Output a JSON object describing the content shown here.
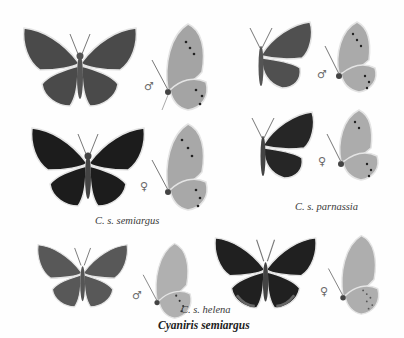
{
  "plate": {
    "title": "Cyaniris semiargus",
    "groups": [
      {
        "caption": "C. s. semiargus",
        "specimens": [
          {
            "view": "upperside",
            "sex": "male",
            "sex_symbol": "♂",
            "wing_tone": "#4a4a4a"
          },
          {
            "view": "underside",
            "sex": "male",
            "sex_symbol": "♂",
            "wing_tone": "#a4a4a4"
          },
          {
            "view": "upperside",
            "sex": "female",
            "sex_symbol": "♀",
            "wing_tone": "#1c1c1c"
          },
          {
            "view": "underside",
            "sex": "female",
            "sex_symbol": "♀",
            "wing_tone": "#a8a8a8"
          }
        ]
      },
      {
        "caption": "C. s. parnassia",
        "specimens": [
          {
            "view": "upperside",
            "sex": "male",
            "sex_symbol": "♂",
            "wing_tone": "#505050"
          },
          {
            "view": "underside",
            "sex": "male",
            "sex_symbol": "♂",
            "wing_tone": "#aaaaaa"
          },
          {
            "view": "upperside",
            "sex": "female",
            "sex_symbol": "♀",
            "wing_tone": "#262626"
          },
          {
            "view": "underside",
            "sex": "female",
            "sex_symbol": "♀",
            "wing_tone": "#acacac"
          }
        ]
      },
      {
        "caption": "C. s. helena",
        "specimens": [
          {
            "view": "upperside",
            "sex": "male",
            "sex_symbol": "♂",
            "wing_tone": "#585858"
          },
          {
            "view": "underside",
            "sex": "male",
            "sex_symbol": "♂",
            "wing_tone": "#b0b0b0"
          },
          {
            "view": "upperside",
            "sex": "female",
            "sex_symbol": "♀",
            "wing_tone": "#202020"
          },
          {
            "view": "underside",
            "sex": "female",
            "sex_symbol": "♀",
            "wing_tone": "#aeaeae"
          }
        ]
      }
    ]
  }
}
